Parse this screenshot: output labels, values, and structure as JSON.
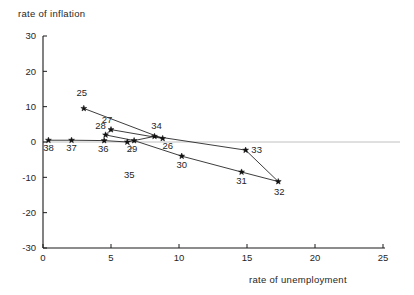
{
  "chart_data": {
    "type": "scatter",
    "title": "",
    "ylabel": "rate  of  inflation",
    "xlabel": "rate  of  unemployment",
    "xlim": [
      0,
      25
    ],
    "ylim": [
      -30,
      30
    ],
    "xticks": [
      0,
      5,
      10,
      15,
      20,
      25
    ],
    "xticklabels": [
      "0",
      "5",
      "10",
      "15",
      "20",
      "25"
    ],
    "yticks": [
      -30,
      -20,
      -10,
      0,
      10,
      20,
      30
    ],
    "yticklabels": [
      "-30",
      "-20",
      "-10",
      "0",
      "10",
      "20",
      "30"
    ],
    "grid": false,
    "legend": null,
    "connected": true,
    "zero_reference_line": 0,
    "marker_style": "star",
    "points": [
      {
        "label": "25",
        "x": 3.0,
        "y": 9.5,
        "label_dx": -2,
        "label_dy": -12
      },
      {
        "label": "26",
        "x": 8.8,
        "y": 1.0,
        "label_dx": 5,
        "label_dy": 11
      },
      {
        "label": "27",
        "x": 5.0,
        "y": 3.5,
        "label_dx": -4,
        "label_dy": -7
      },
      {
        "label": "28",
        "x": 4.6,
        "y": 2.0,
        "label_dx": -5,
        "label_dy": -6
      },
      {
        "label": "29",
        "x": 6.7,
        "y": 0.4,
        "label_dx": -2,
        "label_dy": 11
      },
      {
        "label": "30",
        "x": 10.2,
        "y": -4.0,
        "label_dx": 0,
        "label_dy": 12
      },
      {
        "label": "31",
        "x": 14.6,
        "y": -8.5,
        "label_dx": 0,
        "label_dy": 12
      },
      {
        "label": "32",
        "x": 17.3,
        "y": -11.2,
        "label_dx": 1,
        "label_dy": 13
      },
      {
        "label": "33",
        "x": 14.9,
        "y": -2.3,
        "label_dx": 11,
        "label_dy": 3
      },
      {
        "label": "34",
        "x": 8.2,
        "y": 1.6,
        "label_dx": 2,
        "label_dy": -7
      },
      {
        "label": "35",
        "x": 6.2,
        "y": 0.0,
        "label_dx": 2,
        "label_dy": 36
      },
      {
        "label": "36",
        "x": 4.5,
        "y": 0.4,
        "label_dx": -1,
        "label_dy": 11
      },
      {
        "label": "37",
        "x": 2.1,
        "y": 0.5,
        "label_dx": 0,
        "label_dy": 11
      },
      {
        "label": "38",
        "x": 0.4,
        "y": 0.5,
        "label_dx": 0,
        "label_dy": 11
      }
    ],
    "series_order": [
      "25",
      "26",
      "27",
      "28",
      "29",
      "30",
      "31",
      "32",
      "33",
      "34",
      "35",
      "36",
      "37",
      "38"
    ],
    "annotation_leaders": [
      {
        "label": "35",
        "from_x": 6.4,
        "from_y": -2.6,
        "to_x": 6.1,
        "to_y": 0.0
      }
    ]
  }
}
